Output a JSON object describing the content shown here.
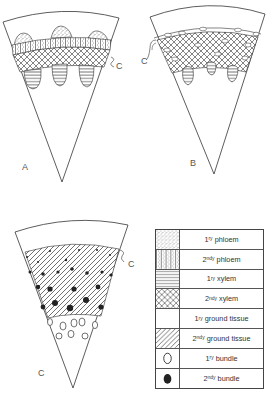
{
  "panels": [
    {
      "id": "A",
      "label": "A",
      "callout": "C"
    },
    {
      "id": "B",
      "label": "B",
      "callout": "C"
    },
    {
      "id": "C",
      "label": "C",
      "callout": "C"
    }
  ],
  "legend": {
    "items": [
      {
        "pattern": "stipple",
        "prefix": "1",
        "sup": "ry",
        "text": "phloem"
      },
      {
        "pattern": "stipple-vertical",
        "prefix": "2",
        "sup": "ndy",
        "text": "phloem"
      },
      {
        "pattern": "horizontal-lines",
        "prefix": "1",
        "sup": "ry",
        "text": "xylem"
      },
      {
        "pattern": "cross-hatch",
        "prefix": "2",
        "sup": "ndy",
        "text": "xylem"
      },
      {
        "pattern": "blank",
        "prefix": "1",
        "sup": "ry",
        "text": "ground tissue"
      },
      {
        "pattern": "diagonal-lines",
        "prefix": "2",
        "sup": "ndy",
        "text": "ground tissue"
      },
      {
        "pattern": "open-circle",
        "prefix": "1",
        "sup": "ry",
        "text": "bundle"
      },
      {
        "pattern": "filled-circle",
        "prefix": "2",
        "sup": "ndy",
        "text": "bundle"
      }
    ]
  },
  "colors": {
    "ink": "#333333",
    "background": "#ffffff"
  }
}
